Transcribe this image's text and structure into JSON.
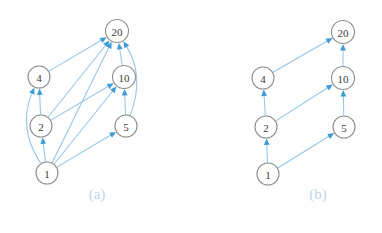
{
  "figure": {
    "background_color": "#fefefe",
    "node_fill": "#ffffff",
    "node_stroke": "#8d8d8d",
    "node_text_color": "#3a3a3a",
    "edge_color": "#93c6e8",
    "arrow_color": "#3e9bd6",
    "caption_color": "#bcd6ea"
  },
  "panels": [
    {
      "id": "a",
      "caption": "(a)",
      "caption_x": 97,
      "caption_y": 199,
      "nodes": [
        {
          "id": "n20",
          "label": "20",
          "cx": 117,
          "cy": 31,
          "r": 11.5
        },
        {
          "id": "n4",
          "label": "4",
          "cx": 39,
          "cy": 77,
          "r": 11.0
        },
        {
          "id": "n10",
          "label": "10",
          "cx": 124,
          "cy": 77,
          "r": 11.5
        },
        {
          "id": "n2",
          "label": "2",
          "cx": 41,
          "cy": 126,
          "r": 11.0
        },
        {
          "id": "n5",
          "label": "5",
          "cx": 126,
          "cy": 126,
          "r": 11.0
        },
        {
          "id": "n1",
          "label": "1",
          "cx": 47,
          "cy": 173,
          "r": 11.0
        }
      ],
      "edges": [
        {
          "from": "n4",
          "to": "n20",
          "curve": 0
        },
        {
          "from": "n2",
          "to": "n4",
          "curve": 0
        },
        {
          "from": "n2",
          "to": "n20",
          "curve": 0
        },
        {
          "from": "n2",
          "to": "n10",
          "curve": 0
        },
        {
          "from": "n1",
          "to": "n2",
          "curve": 0
        },
        {
          "from": "n1",
          "to": "n4",
          "curve": -26
        },
        {
          "from": "n1",
          "to": "n20",
          "curve": 0
        },
        {
          "from": "n1",
          "to": "n10",
          "curve": 0
        },
        {
          "from": "n1",
          "to": "n5",
          "curve": 0
        },
        {
          "from": "n5",
          "to": "n10",
          "curve": 0
        },
        {
          "from": "n5",
          "to": "n20",
          "curve": 24
        },
        {
          "from": "n10",
          "to": "n20",
          "curve": 0
        }
      ]
    },
    {
      "id": "b",
      "caption": "(b)",
      "caption_x": 318,
      "caption_y": 199,
      "nodes": [
        {
          "id": "n20",
          "label": "20",
          "cx": 343,
          "cy": 32,
          "r": 11.5
        },
        {
          "id": "n4",
          "label": "4",
          "cx": 263,
          "cy": 78,
          "r": 11.0
        },
        {
          "id": "n10",
          "label": "10",
          "cx": 343,
          "cy": 78,
          "r": 11.5
        },
        {
          "id": "n2",
          "label": "2",
          "cx": 266,
          "cy": 127,
          "r": 11.0
        },
        {
          "id": "n5",
          "label": "5",
          "cx": 344,
          "cy": 127,
          "r": 11.0
        },
        {
          "id": "n1",
          "label": "1",
          "cx": 268,
          "cy": 174,
          "r": 11.0
        }
      ],
      "edges": [
        {
          "from": "n4",
          "to": "n20",
          "curve": 0
        },
        {
          "from": "n2",
          "to": "n4",
          "curve": 0
        },
        {
          "from": "n2",
          "to": "n10",
          "curve": 0
        },
        {
          "from": "n1",
          "to": "n2",
          "curve": 0
        },
        {
          "from": "n1",
          "to": "n5",
          "curve": 0
        },
        {
          "from": "n5",
          "to": "n10",
          "curve": 0
        },
        {
          "from": "n10",
          "to": "n20",
          "curve": 0
        }
      ]
    }
  ]
}
